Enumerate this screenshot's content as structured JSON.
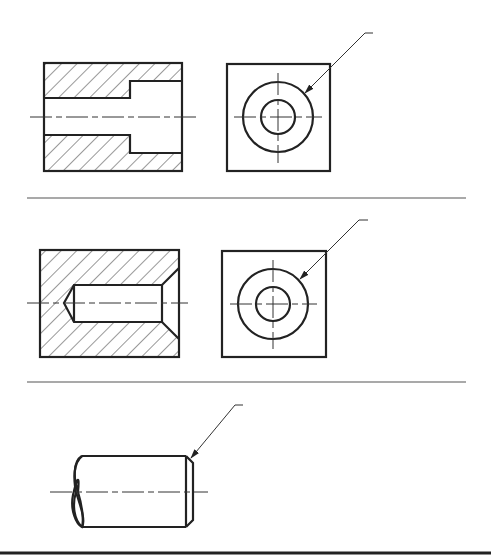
{
  "figure": {
    "type": "engineering-drawing",
    "panels": [
      {
        "id": "panel-1",
        "views": [
          "section-view-counterbored-hole",
          "end-view-concentric-circles"
        ],
        "leader_target": "outer circle of end view"
      },
      {
        "id": "panel-2",
        "views": [
          "section-view-blind-hole-with-chamfer",
          "end-view-concentric-circles"
        ],
        "leader_target": "outer circle of end view"
      },
      {
        "id": "panel-3",
        "views": [
          "shaft-with-chamfered-end"
        ],
        "leader_target": "chamfer at shaft end"
      }
    ],
    "icons": {
      "leader_arrow": "arrow-icon"
    },
    "colors": {
      "line": "#222222",
      "background": "#ffffff"
    }
  }
}
